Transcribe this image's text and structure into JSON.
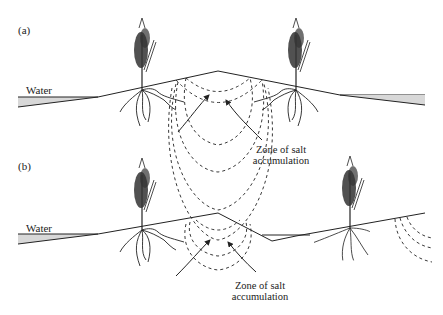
{
  "panels": [
    {
      "id": "a",
      "label": "(a)",
      "water_label": "Water",
      "zone_label_line1": "Zone of salt",
      "zone_label_line2": "accumulation"
    },
    {
      "id": "b",
      "label": "(b)",
      "water_label": "Water",
      "zone_label_line1": "Zone of salt",
      "zone_label_line2": "accumulation"
    }
  ],
  "colors": {
    "line": "#222222",
    "water": "#d8d8d8",
    "background": "#ffffff"
  }
}
